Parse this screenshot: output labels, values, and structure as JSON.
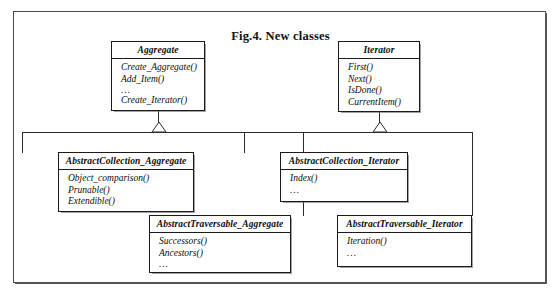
{
  "figure": {
    "title": "Fig.4. New classes"
  },
  "classes": [
    {
      "id": "aggregate",
      "name": "Aggregate",
      "operations": [
        "Create_Aggregate()",
        "Add_Item()",
        "...",
        "Create_Iterator()"
      ]
    },
    {
      "id": "iterator",
      "name": "Iterator",
      "operations": [
        "First()",
        "Next()",
        "IsDone()",
        "CurrentItem()"
      ]
    },
    {
      "id": "abstract-collection-aggregate",
      "name": "AbstractCollection_Aggregate",
      "operations": [
        "Object_comparison()",
        "Prunable()",
        "Extendible()"
      ]
    },
    {
      "id": "abstract-collection-iterator",
      "name": "AbstractCollection_Iterator",
      "operations": [
        "Index()",
        "..."
      ]
    },
    {
      "id": "abstract-traversable-aggregate",
      "name": "AbstractTraversable_Aggregate",
      "operations": [
        "Successors()",
        "Ancestors()",
        "..."
      ]
    },
    {
      "id": "abstract-traversable-iterator",
      "name": "AbstractTraversable_Iterator",
      "operations": [
        "Iteration()",
        "..."
      ]
    }
  ],
  "relations": [
    {
      "type": "generalization",
      "parent": "Aggregate",
      "children": [
        "AbstractCollection_Aggregate",
        "AbstractTraversable_Aggregate"
      ]
    },
    {
      "type": "generalization",
      "parent": "Iterator",
      "children": [
        "AbstractCollection_Iterator",
        "AbstractTraversable_Iterator"
      ]
    }
  ],
  "colors": {
    "frame": "#4a4a4a",
    "box_border": "#1a1a1a",
    "text": "#0d0d0d",
    "line": "#2a2a2a",
    "background": "#ffffff"
  }
}
